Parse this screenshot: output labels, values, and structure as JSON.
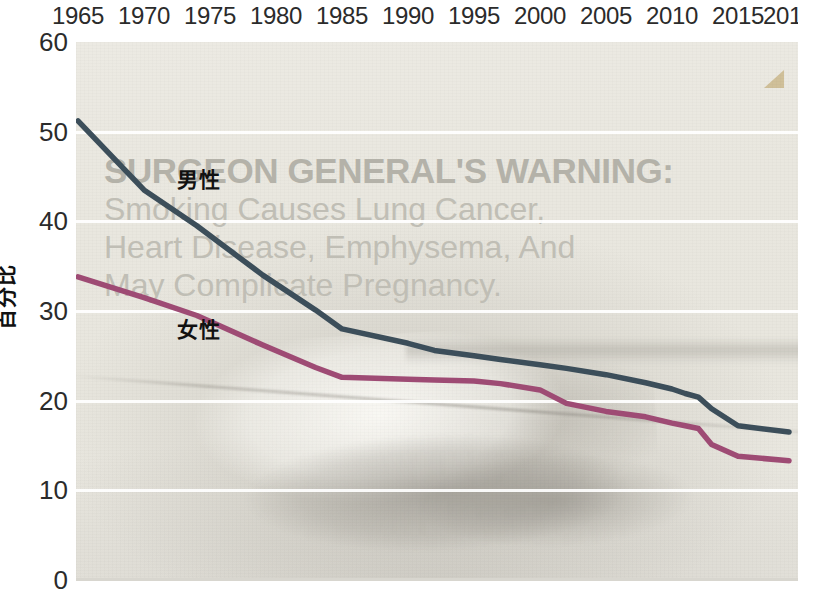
{
  "chart_data": {
    "type": "line",
    "title": "",
    "xlabel": "",
    "ylabel": "百分比",
    "xlim": [
      1965,
      2016
    ],
    "ylim": [
      0,
      60
    ],
    "grid": true,
    "legend_position": "inline-labels",
    "x_tick_labels": [
      "1965",
      "1970",
      "1975",
      "1980",
      "1985",
      "1990",
      "1995",
      "2000",
      "2005",
      "2010",
      "2015",
      "2016"
    ],
    "y_tick_labels": [
      "0",
      "10",
      "20",
      "30",
      "40",
      "50",
      "60"
    ],
    "y_ticks": [
      0,
      10,
      20,
      30,
      40,
      50,
      60
    ],
    "x": [
      1965,
      1970,
      1974,
      1979,
      1983,
      1985,
      1990,
      1992,
      1995,
      1997,
      2000,
      2002,
      2005,
      2008,
      2010,
      2011,
      2012,
      2013,
      2015,
      2016
    ],
    "series": [
      {
        "name": "男性",
        "color": "#3c4e5a",
        "label_x_year": 1972.5,
        "label_y_value": 45.0,
        "values": [
          51.2,
          43.5,
          39.5,
          34.0,
          30.1,
          28.0,
          26.4,
          25.6,
          25.0,
          24.6,
          24.0,
          23.6,
          22.9,
          22.0,
          21.3,
          20.8,
          20.4,
          19.1,
          17.2,
          16.5
        ]
      },
      {
        "name": "女性",
        "color": "#9e4b74",
        "label_x_year": 1972.5,
        "label_y_value": 28.2,
        "values": [
          33.8,
          31.5,
          29.5,
          26.2,
          23.7,
          22.6,
          22.4,
          22.3,
          22.2,
          21.9,
          21.2,
          19.7,
          18.8,
          18.2,
          17.5,
          17.2,
          16.9,
          15.1,
          13.8,
          13.3
        ]
      }
    ]
  },
  "background_notice": {
    "heading": "SURGEON GENERAL'S WARNING:",
    "lines": [
      "Smoking Causes Lung Cancer,",
      "Heart Disease, Emphysema, And",
      "May Complicate Pregnancy."
    ]
  }
}
